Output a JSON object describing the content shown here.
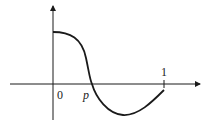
{
  "diagram": {
    "type": "function-graph",
    "labels": {
      "origin": "0",
      "root": "p",
      "x_end": "1"
    },
    "key_points": [
      {
        "name": "y-intercept",
        "x": 0,
        "y_sign": "positive"
      },
      {
        "name": "root",
        "x": "p",
        "y": 0
      },
      {
        "name": "minimum",
        "x_between": [
          "p",
          "1"
        ],
        "y_sign": "negative"
      },
      {
        "name": "endpoint",
        "x": 1,
        "y_sign": "negative"
      }
    ],
    "colors": {
      "ink": "#1a1a1a",
      "background": "#ffffff"
    }
  }
}
